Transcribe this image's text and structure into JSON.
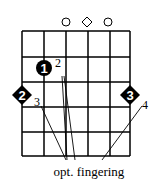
{
  "diagram": {
    "type": "guitar-chord-diagram",
    "strings": 6,
    "frets_shown": 4,
    "open_markers": [
      {
        "string": 3,
        "symbol": "circle"
      },
      {
        "string": 4,
        "symbol": "diamond"
      },
      {
        "string": 5,
        "symbol": "circle"
      }
    ],
    "notes": [
      {
        "string": 2,
        "fret": 2,
        "finger": "1",
        "shape": "circle",
        "alt_finger": "2"
      },
      {
        "string": 1,
        "fret": 3,
        "finger": "2",
        "shape": "diamond",
        "alt_finger": "3"
      },
      {
        "string": 6,
        "fret": 3,
        "finger": "3",
        "shape": "diamond",
        "alt_finger": "4"
      }
    ],
    "caption": "opt. fingering",
    "colors": {
      "line": "#000000",
      "marker": "#000000",
      "marker_text": "#ffffff",
      "background": "#ffffff"
    }
  }
}
